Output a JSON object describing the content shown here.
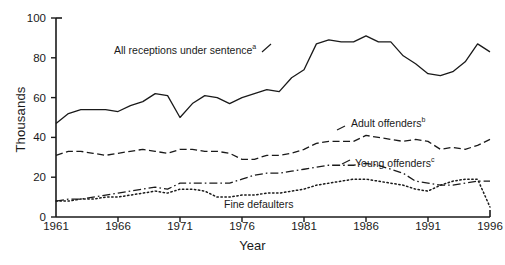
{
  "chart": {
    "ylabel": "Thousands",
    "xlabel": "Year"
  },
  "annotations": {
    "all_receptions": "All receptions under sentence",
    "all_receptions_note": "a",
    "adult_offenders": "Adult offenders",
    "adult_offenders_note": "b",
    "young_offenders": "Young offenders",
    "young_offenders_note": "c",
    "fine_defaulters": "Fine defaulters"
  },
  "colors": {
    "axis": "#1a1a1a",
    "line": "#1a1a1a",
    "background": "#ffffff"
  },
  "chart_data": {
    "type": "line",
    "title": "",
    "xlabel": "Year",
    "ylabel": "Thousands",
    "xlim": [
      1961,
      1996
    ],
    "ylim": [
      0,
      100
    ],
    "grid": false,
    "legend_position": "inline-annotations",
    "yticks": [
      0,
      20,
      40,
      60,
      80,
      100
    ],
    "xticks": [
      1961,
      1966,
      1971,
      1976,
      1981,
      1986,
      1991,
      1996
    ],
    "x": [
      1961,
      1962,
      1963,
      1964,
      1965,
      1966,
      1967,
      1968,
      1969,
      1970,
      1971,
      1972,
      1973,
      1974,
      1975,
      1976,
      1977,
      1978,
      1979,
      1980,
      1981,
      1982,
      1983,
      1984,
      1985,
      1986,
      1987,
      1988,
      1989,
      1990,
      1991,
      1992,
      1993,
      1994,
      1995,
      1996
    ],
    "series": [
      {
        "name": "All receptions under sentence",
        "note": "a",
        "style": "solid",
        "values": [
          47,
          52,
          54,
          54,
          54,
          53,
          56,
          58,
          62,
          61,
          50,
          57,
          61,
          60,
          57,
          60,
          62,
          64,
          63,
          70,
          74,
          87,
          89,
          88,
          88,
          91,
          88,
          88,
          81,
          77,
          72,
          71,
          73,
          78,
          87,
          83
        ]
      },
      {
        "name": "Adult offenders",
        "note": "b",
        "style": "dashed",
        "values": [
          31,
          33,
          33,
          32,
          31,
          32,
          33,
          34,
          33,
          32,
          34,
          34,
          33,
          33,
          32,
          29,
          29,
          31,
          31,
          32,
          34,
          37,
          38,
          38,
          38,
          41,
          40,
          39,
          38,
          39,
          38,
          34,
          35,
          34,
          36,
          39
        ]
      },
      {
        "name": "Young offenders",
        "note": "c",
        "style": "dash-dot",
        "values": [
          8,
          9,
          9,
          10,
          11,
          12,
          13,
          14,
          15,
          14,
          17,
          17,
          17,
          17,
          17,
          19,
          21,
          22,
          22,
          23,
          24,
          25,
          26,
          26,
          26,
          27,
          26,
          24,
          22,
          18,
          17,
          16,
          16,
          17,
          18,
          18
        ]
      },
      {
        "name": "Fine defaulters",
        "style": "dotted",
        "values": [
          8,
          8,
          9,
          9,
          10,
          10,
          11,
          12,
          13,
          12,
          14,
          14,
          13,
          10,
          10,
          11,
          11,
          12,
          12,
          13,
          14,
          16,
          17,
          18,
          19,
          19,
          18,
          17,
          16,
          14,
          13,
          16,
          18,
          19,
          19,
          5
        ]
      }
    ]
  }
}
